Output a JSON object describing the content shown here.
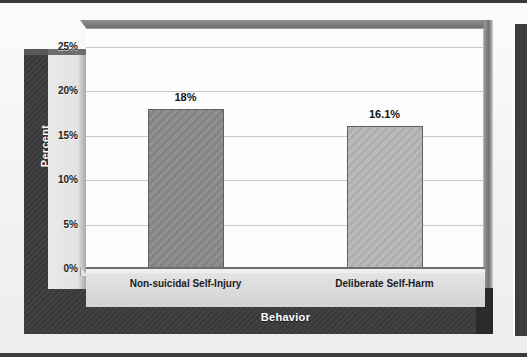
{
  "figure": {
    "background_color": "#f2f2f2",
    "facing_page_color": "#3d3d3d"
  },
  "chart_data": {
    "type": "bar",
    "title": "",
    "subtitle": "",
    "xlabel": "Behavior",
    "ylabel": "Percent",
    "categories": [
      "Non-suicidal Self-Injury",
      "Deliberate Self-Harm"
    ],
    "values": [
      18,
      16.1
    ],
    "value_labels": [
      "18%",
      "16.1%"
    ],
    "ylim": [
      0,
      27
    ],
    "yticks": [
      0,
      5,
      10,
      15,
      20,
      25
    ],
    "ytick_labels": [
      "0%",
      "5%",
      "10%",
      "15%",
      "20%",
      "25%"
    ],
    "grid": true,
    "grid_axis": "y",
    "legend": false,
    "legend_position": "none",
    "style": "3d-excel-classic",
    "bar_colors": [
      "#8a8a8a",
      "#b6b6b6"
    ],
    "bar_border_color": "#5f5f5f",
    "gridline_color": "#c9c9c9",
    "plot_background_color": "#fdfdfd",
    "wall_color": "#3b3b3b",
    "axis_strip_color": "#e3e3e3",
    "axis_title_color": "#ffffff",
    "tick_label_color": "#1f1f1f"
  }
}
